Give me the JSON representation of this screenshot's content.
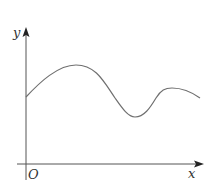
{
  "figure": {
    "type": "function-graph",
    "axes": {
      "x_label": "x",
      "y_label": "y",
      "origin_label": "O"
    },
    "colors": {
      "axis": "#555555",
      "arrow": "#222222",
      "curve": "#6f6f6f",
      "label": "#333333",
      "background": "#ffffff"
    },
    "curve_description": "Smooth curve starting on the y-axis above the origin, rising to a maximum, falling to a minimum, rising to a smaller local maximum, then decreasing slightly at the right edge",
    "key_points": [
      {
        "name": "start",
        "x": 26,
        "y": 97
      },
      {
        "name": "local-max-1",
        "x": 76,
        "y": 65
      },
      {
        "name": "local-min",
        "x": 135,
        "y": 117
      },
      {
        "name": "local-max-2",
        "x": 172,
        "y": 88
      },
      {
        "name": "end",
        "x": 200,
        "y": 98
      }
    ]
  }
}
